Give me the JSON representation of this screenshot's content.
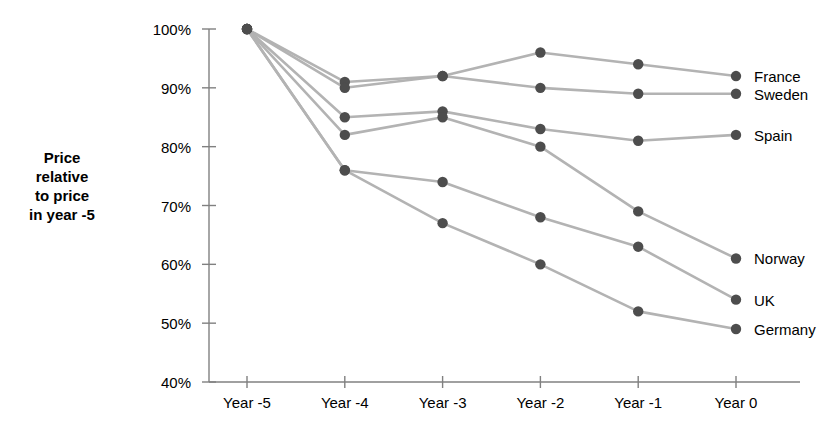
{
  "chart_data": {
    "type": "line",
    "title": "",
    "xlabel": "",
    "ylabel": "Price relative to price in year -5",
    "categories": [
      "Year -5",
      "Year -4",
      "Year -3",
      "Year -2",
      "Year -1",
      "Year 0"
    ],
    "ylim": [
      40,
      100
    ],
    "yticks": [
      40,
      50,
      60,
      70,
      80,
      90,
      100
    ],
    "ytick_labels": [
      "40%",
      "50%",
      "60%",
      "70%",
      "80%",
      "90%",
      "100%"
    ],
    "grid": false,
    "legend_position": "right-of-line-ends",
    "value_suffix": "%",
    "series": [
      {
        "name": "France",
        "values": [
          100,
          91,
          92,
          96,
          94,
          92
        ]
      },
      {
        "name": "Sweden",
        "values": [
          100,
          90,
          92,
          90,
          89,
          89
        ]
      },
      {
        "name": "Spain",
        "values": [
          100,
          85,
          86,
          83,
          81,
          82
        ]
      },
      {
        "name": "Norway",
        "values": [
          100,
          82,
          85,
          80,
          69,
          61
        ]
      },
      {
        "name": "UK",
        "values": [
          100,
          76,
          74,
          68,
          63,
          54
        ]
      },
      {
        "name": "Germany",
        "values": [
          100,
          76,
          67,
          60,
          52,
          49
        ]
      }
    ],
    "colors": {
      "line": "#b3b3b3",
      "marker": "#4d4d4d",
      "axis": "#808080",
      "text": "#000000",
      "background": "#ffffff"
    }
  },
  "y_axis_title_lines": {
    "line1": "Price",
    "line2": "relative",
    "line3": "to price",
    "line4": "in year -5"
  }
}
